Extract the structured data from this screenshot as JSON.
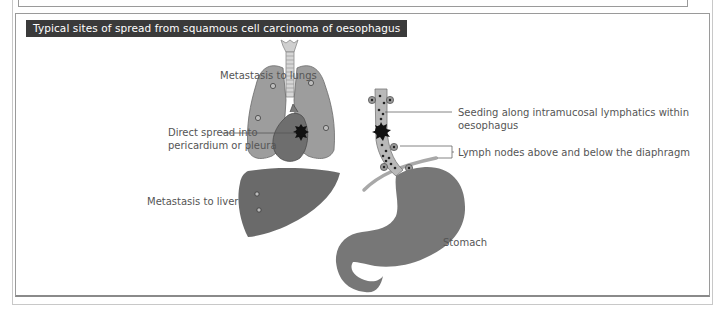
{
  "figure": {
    "title": "Typical sites of spread from squamous cell carcinoma of oesophagus",
    "labels": {
      "lungs": "Metastasis to lungs",
      "pericardium_line1": "Direct spread into",
      "pericardium_line2": "pericardium or pleura",
      "liver": "Metastasis to liver",
      "seeding_line1": "Seeding along intramucosal lymphatics within",
      "seeding_line2": "oesophagus",
      "lymph_nodes": "Lymph nodes above and below the diaphragm",
      "stomach": "Stomach"
    },
    "colors": {
      "title_bg": "#3a3a3a",
      "title_text": "#ffffff",
      "lung": "#9d9d9d",
      "heart": "#6e6e6e",
      "liver": "#6a6a6a",
      "stomach": "#777777",
      "oesophagus": "#b9b9b9",
      "diaphragm": "#a8a8a8",
      "tumour": "#111111",
      "label_text": "#555555"
    }
  }
}
